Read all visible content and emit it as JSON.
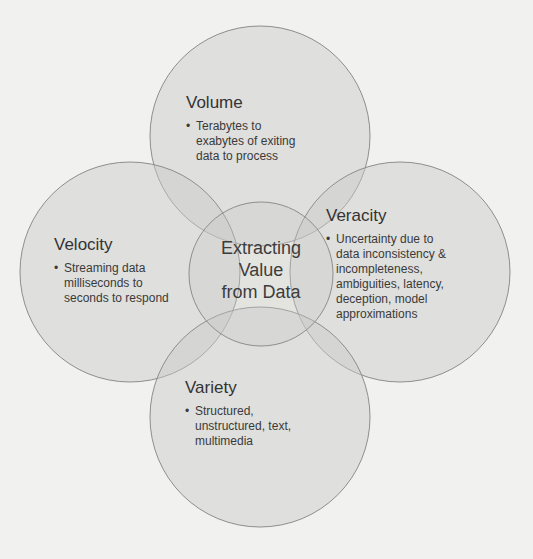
{
  "diagram": {
    "type": "venn-flower",
    "center": {
      "lines": [
        "Extracting",
        "Value",
        "from Data"
      ]
    },
    "petals": [
      {
        "id": "volume",
        "title": "Volume",
        "bullet": [
          "Terabytes to",
          "exabytes of exiting",
          "data to process"
        ]
      },
      {
        "id": "velocity",
        "title": "Velocity",
        "bullet": [
          "Streaming data",
          "milliseconds to",
          "seconds to respond"
        ]
      },
      {
        "id": "veracity",
        "title": "Veracity",
        "bullet": [
          "Uncertainty due to",
          "data inconsistency &",
          "incompleteness,",
          "ambiguities, latency,",
          "deception, model",
          "approximations"
        ]
      },
      {
        "id": "variety",
        "title": "Variety",
        "bullet": [
          "Structured,",
          "unstructured, text,",
          "multimedia"
        ]
      }
    ],
    "colors": {
      "background": "#f1f1ef",
      "circle_fill": "#c9c9c7",
      "circle_stroke": "#8e8e8c",
      "text": "#3a3a3a"
    }
  }
}
